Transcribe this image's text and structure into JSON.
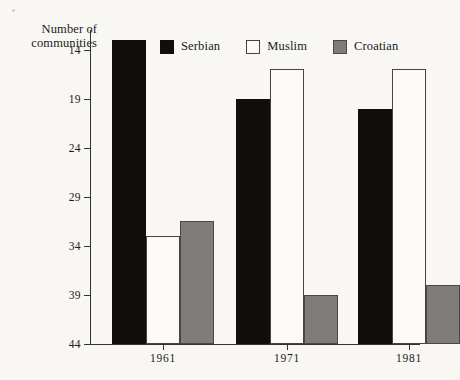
{
  "figure": {
    "background_color": "#f8f7f4",
    "axis_title_line1": "Number of",
    "axis_title_line2": "communities"
  },
  "legend": {
    "position": "top-center",
    "items": [
      {
        "label": "Serbian",
        "swatch": "black-square-icon",
        "color": "#100f0d"
      },
      {
        "label": "Muslim",
        "swatch": "white-square-icon",
        "color": "#ffffff"
      },
      {
        "label": "Croatian",
        "swatch": "gray-square-icon",
        "color": "#7f7d79"
      }
    ]
  },
  "axes": {
    "y_ticks": [
      "44",
      "39",
      "34",
      "29",
      "24",
      "19",
      "14"
    ],
    "y_tick_values": [
      44,
      39,
      34,
      29,
      24,
      19,
      14
    ],
    "x_ticks": [
      "1961",
      "1971",
      "1981"
    ]
  },
  "chart_data": {
    "type": "bar",
    "title": "",
    "subtitle": "",
    "xlabel": "",
    "ylabel": "Number of communities",
    "categories": [
      "1961",
      "1971",
      "1981"
    ],
    "series": [
      {
        "name": "Serbian",
        "color": "#100f0d",
        "values": [
          45,
          39,
          38
        ]
      },
      {
        "name": "Muslim",
        "color": "#ffffff",
        "values": [
          25,
          42,
          42
        ]
      },
      {
        "name": "Croatian",
        "color": "#7f7d79",
        "values": [
          26.5,
          19,
          20
        ]
      }
    ],
    "ylim": [
      14,
      46
    ],
    "yticks": [
      14,
      19,
      24,
      29,
      34,
      39,
      44
    ],
    "grid": false,
    "legend_position": "top-center",
    "bar_grouping": "grouped"
  }
}
